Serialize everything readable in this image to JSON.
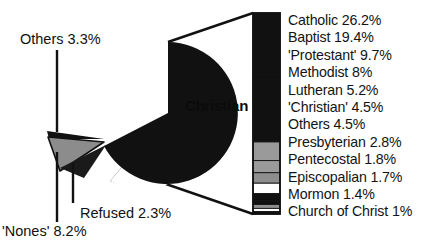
{
  "chart_data": {
    "type": "pie",
    "title": "",
    "subtitle": "",
    "xlabel": "",
    "ylabel": "",
    "legend_position": "right",
    "grid": false,
    "units": "percent",
    "categories": [
      "Christian",
      "'Nones'",
      "Others",
      "Refused"
    ],
    "values": [
      86.2,
      8.2,
      3.3,
      2.3
    ],
    "slices": [
      {
        "label": "Christian",
        "value": 86.2,
        "display": "86.2%",
        "color": "#111111",
        "exploded": false
      },
      {
        "label": "'Nones'",
        "value": 8.2,
        "display": "8.2%",
        "color": "#8c8c8c",
        "exploded": true
      },
      {
        "label": "Others",
        "value": 3.3,
        "display": "3.3%",
        "color": "#111111",
        "exploded": true
      },
      {
        "label": "Refused",
        "value": 2.3,
        "display": "2.3%",
        "color": "#2b2b2b",
        "exploded": true
      }
    ],
    "breakout": {
      "of_slice": "Christian",
      "type": "bar",
      "orientation": "vertical-stacked",
      "categories": [
        "Catholic",
        "Baptist",
        "'Protestant'",
        "Methodist",
        "Lutheran",
        "'Christian'",
        "Others",
        "Presbyterian",
        "Pentecostal",
        "Episcopalian",
        "Mormon",
        "Church of Christ"
      ],
      "values": [
        26.2,
        19.4,
        9.7,
        8,
        5.2,
        4.5,
        4.5,
        2.8,
        1.8,
        1.7,
        1.4,
        1
      ],
      "items": [
        {
          "label": "Catholic",
          "value": 26.2,
          "display": "26.2%",
          "text": "Catholic 26.2%",
          "color": "#111111"
        },
        {
          "label": "Baptist",
          "value": 19.4,
          "display": "19.4%",
          "text": "Baptist 19.4%",
          "color": "#111111"
        },
        {
          "label": "'Protestant'",
          "value": 9.7,
          "display": "9.7%",
          "text": "'Protestant' 9.7%",
          "color": "#111111"
        },
        {
          "label": "Methodist",
          "value": 8,
          "display": "8%",
          "text": "Methodist 8%",
          "color": "#9a9a9a"
        },
        {
          "label": "Lutheran",
          "value": 5.2,
          "display": "5.2%",
          "text": "Lutheran 5.2%",
          "color": "#9a9a9a"
        },
        {
          "label": "'Christian'",
          "value": 4.5,
          "display": "4.5%",
          "text": "'Christian' 4.5%",
          "color": "#8e8e8e"
        },
        {
          "label": "Others",
          "value": 4.5,
          "display": "4.5%",
          "text": "Others 4.5%",
          "color": "#ffffff"
        },
        {
          "label": "Presbyterian",
          "value": 2.8,
          "display": "2.8%",
          "text": "Presbyterian 2.8%",
          "color": "#111111"
        },
        {
          "label": "Pentecostal",
          "value": 1.8,
          "display": "1.8%",
          "text": "Pentecostal 1.8%",
          "color": "#111111"
        },
        {
          "label": "Episcopalian",
          "value": 1.7,
          "display": "1.7%",
          "text": "Episcopalian 1.7%",
          "color": "#8e8e8e"
        },
        {
          "label": "Mormon",
          "value": 1.4,
          "display": "1.4%",
          "text": "Mormon 1.4%",
          "color": "#ffffff"
        },
        {
          "label": "Church of Christ",
          "value": 1,
          "display": "1%",
          "text": "Church of Christ 1%",
          "color": "#111111"
        }
      ]
    },
    "annotations": [
      {
        "name": "others-callout",
        "text": "Others 3.3%"
      },
      {
        "name": "refused-callout",
        "text": "Refused 2.3%"
      },
      {
        "name": "nones-callout",
        "text": "'Nones' 8.2%"
      },
      {
        "name": "christian-callout",
        "text": "Christian 86.2%"
      }
    ]
  },
  "pie": {
    "center_label": {
      "name": "Christian",
      "percent": "86.2%"
    },
    "callouts": {
      "others": "Others 3.3%",
      "refused": "Refused 2.3%",
      "nones": "'Nones' 8.2%"
    }
  },
  "colors": {
    "ink": "#111111",
    "background": "#ffffff",
    "slice_dark": "#111111",
    "slice_gray": "#8c8c8c",
    "slice_mid": "#2b2b2b"
  }
}
